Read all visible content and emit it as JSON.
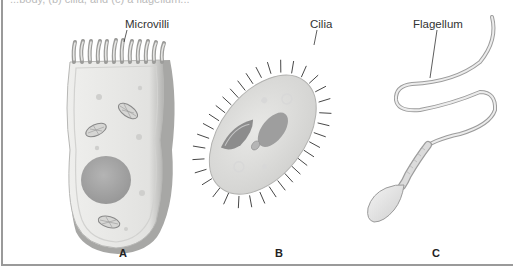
{
  "figure": {
    "caption_fragment": "...body, (b) cilia, and (c) a flagellum...",
    "panels": [
      {
        "letter": "A",
        "structure_label": "Microvilli",
        "subject": "epithelial cell with microvilli"
      },
      {
        "letter": "B",
        "structure_label": "Cilia",
        "subject": "ciliated protist (paramecium)"
      },
      {
        "letter": "C",
        "structure_label": "Flagellum",
        "subject": "sperm cell with flagellum"
      }
    ]
  },
  "colors": {
    "background": "#ffffff",
    "border": "#9a9a9a",
    "cell_fill": "#e4e4e2",
    "cell_edge": "#a8a8a8",
    "nucleus": "#a9a9a9",
    "cilia": "#444444",
    "label_text": "#333333"
  }
}
